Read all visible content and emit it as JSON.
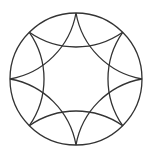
{
  "diagram": {
    "type": "geometric-figure",
    "stroke_color": "#333333",
    "background": "#ffffff",
    "circle": {
      "cx": 76,
      "cy": 79,
      "r": 66
    },
    "point_count": 8,
    "arc_radius": 81.5
  }
}
